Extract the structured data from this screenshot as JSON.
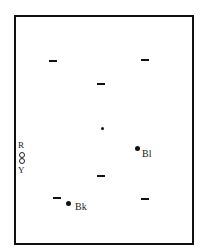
{
  "diagram": {
    "type": "point-layout",
    "frame": {
      "stroke": "#111111"
    },
    "dashes": [
      {
        "x": 53,
        "y": 61
      },
      {
        "x": 145,
        "y": 60
      },
      {
        "x": 101,
        "y": 84
      },
      {
        "x": 101,
        "y": 176
      },
      {
        "x": 57,
        "y": 198
      },
      {
        "x": 145,
        "y": 199
      }
    ],
    "center_dot": {
      "x": 102,
      "y": 128
    },
    "labeled_dots": [
      {
        "id": "bl",
        "label": "Bl",
        "x": 138,
        "y": 148
      },
      {
        "id": "bk",
        "label": "Bk",
        "x": 68,
        "y": 203
      }
    ],
    "side_marker": {
      "top_label": "R",
      "bottom_label": "Y",
      "symbol": "double-circle"
    }
  }
}
